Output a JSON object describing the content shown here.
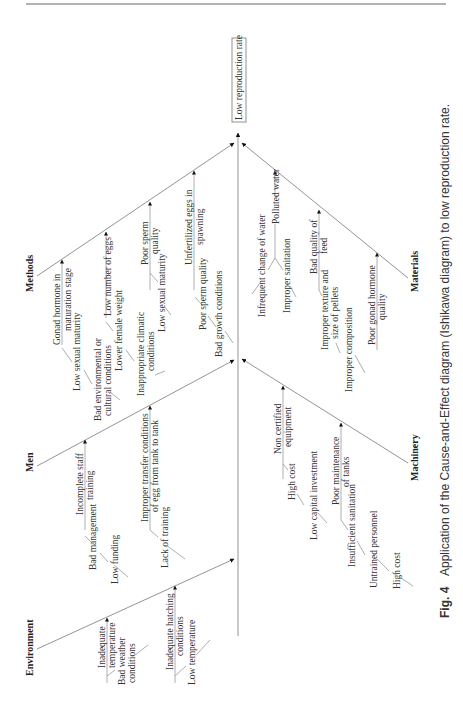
{
  "figure": {
    "effect": "Low reproduction rate",
    "caption_label": "Fig. 4",
    "caption_text": "Application of the Cause-and-Effect diagram (Ishikawa diagram) to low reproduction rate."
  },
  "categories": {
    "methods": {
      "label": "Methods",
      "causes": {
        "c0": {
          "lines": [
            "Gonad hormone in",
            "maturation stage"
          ]
        },
        "c0s0": {
          "lines": [
            "Low sexual maturity"
          ]
        },
        "c0s1": {
          "lines": [
            "Bad environmental or",
            "cultural conditions"
          ]
        },
        "c1": {
          "lines": [
            "Low number of eggs"
          ]
        },
        "c1s0": {
          "lines": [
            "Lower female weight"
          ]
        },
        "c1s1": {
          "lines": [
            "Inappropriate climatic",
            "conditions"
          ]
        },
        "c2": {
          "lines": [
            "Poor sperm",
            "quality"
          ]
        },
        "c2s0": {
          "lines": [
            "Low sexual maturity"
          ]
        },
        "c3": {
          "lines": [
            "Unfertilized eggs in",
            "spawning"
          ]
        },
        "c3s0": {
          "lines": [
            "Poor sperm quality"
          ]
        },
        "c3s1": {
          "lines": [
            "Bad growth conditions"
          ]
        }
      }
    },
    "men": {
      "label": "Men",
      "causes": {
        "c0": {
          "lines": [
            "Incomplete staff",
            "training"
          ]
        },
        "c0s0": {
          "lines": [
            "Bad management"
          ]
        },
        "c0s1": {
          "lines": [
            "Low funding"
          ]
        },
        "c1": {
          "lines": [
            "Improper transfer conditions",
            "of egg from tank to tank"
          ]
        },
        "c1s0": {
          "lines": [
            "Lack of training"
          ]
        }
      }
    },
    "environment": {
      "label": "Environment",
      "causes": {
        "c0": {
          "lines": [
            "Inadequate",
            "temperature"
          ]
        },
        "c0s0": {
          "lines": [
            "Bad weather",
            "conditions"
          ]
        },
        "c1": {
          "lines": [
            "Inadequate hatching",
            "conditions"
          ]
        },
        "c1s0": {
          "lines": [
            "Low temperature"
          ]
        }
      }
    },
    "materials": {
      "label": "Materials",
      "causes": {
        "c0": {
          "lines": [
            "Polluted water"
          ]
        },
        "c0s0": {
          "lines": [
            "Infrequent change of water"
          ]
        },
        "c0s1": {
          "lines": [
            "Improper sanitation"
          ]
        },
        "c1": {
          "lines": [
            "Bad quality of",
            "feed"
          ]
        },
        "c1s0": {
          "lines": [
            "Improper texture and",
            "size of pellets"
          ]
        },
        "c1s1": {
          "lines": [
            "Improper composition"
          ]
        },
        "c2": {
          "lines": [
            "Poor gonad hormone",
            "quality"
          ]
        }
      }
    },
    "machinery": {
      "label": "Machinery",
      "causes": {
        "c0": {
          "lines": [
            "Non certified",
            "equipment"
          ]
        },
        "c0s0": {
          "lines": [
            "High cost"
          ]
        },
        "c0s1": {
          "lines": [
            "Low capital investment"
          ]
        },
        "c1": {
          "lines": [
            "Poor maintenance",
            "of tanks"
          ]
        },
        "c1s0": {
          "lines": [
            "Insufficient sanitation"
          ]
        },
        "c1s1": {
          "lines": [
            "Untrained personnel"
          ]
        },
        "c1s2": {
          "lines": [
            "High cost"
          ]
        }
      }
    }
  }
}
